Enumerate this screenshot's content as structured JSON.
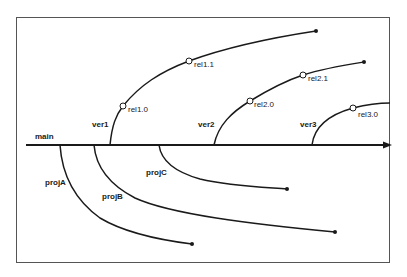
{
  "diagram": {
    "type": "version-branch-tree",
    "trunk": {
      "label": "main"
    },
    "version_branches": [
      {
        "label": "ver1",
        "releases": [
          "rel1.0",
          "rel1.1"
        ]
      },
      {
        "label": "ver2",
        "releases": [
          "rel2.0",
          "rel2.1"
        ]
      },
      {
        "label": "ver3",
        "releases": [
          "rel3.0"
        ]
      }
    ],
    "project_branches": [
      {
        "label": "projA"
      },
      {
        "label": "projB"
      },
      {
        "label": "projC"
      }
    ],
    "colors": {
      "line": "#1a1a1a",
      "frame": "#555555",
      "background": "#ffffff"
    }
  }
}
